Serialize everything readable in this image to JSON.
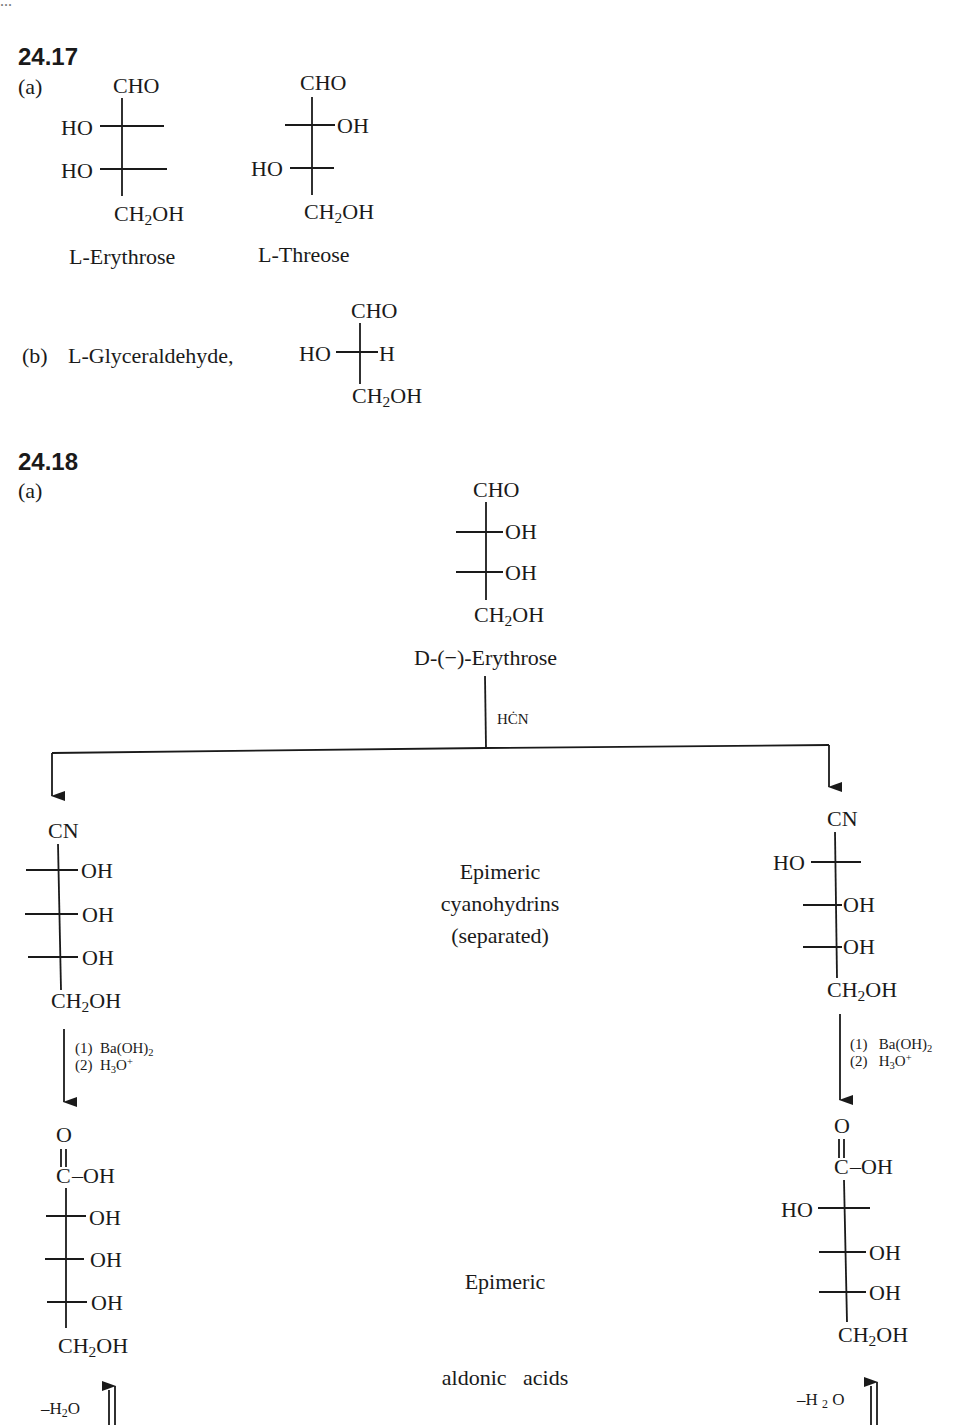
{
  "cutoff_text": "...",
  "problem_24_17": {
    "number": "24.17",
    "part_a": {
      "label": "(a)",
      "erythrose": {
        "top": "CHO",
        "row1_left": "HO",
        "row2_left": "HO",
        "bottom_main": "CH",
        "bottom_sub": "2",
        "bottom_tail": "OH",
        "name_prefix": "L",
        "name_rest": "-Erythrose"
      },
      "threose": {
        "top": "CHO",
        "row1_right": "OH",
        "row2_left": "HO",
        "bottom_main": "CH",
        "bottom_sub": "2",
        "bottom_tail": "OH",
        "name_prefix": "L",
        "name_rest": "-Threose"
      }
    },
    "part_b": {
      "label": "(b)",
      "name_prefix": "L",
      "name_rest": "-Glyceraldehyde,",
      "structure": {
        "top": "CHO",
        "left": "HO",
        "right": "H",
        "bottom_main": "CH",
        "bottom_sub": "2",
        "bottom_tail": "OH"
      }
    }
  },
  "problem_24_18": {
    "number": "24.18",
    "part_a": {
      "label": "(a)",
      "start": {
        "top": "CHO",
        "row1_right": "OH",
        "row2_right": "OH",
        "bottom_main": "CH",
        "bottom_sub": "2",
        "bottom_tail": "OH",
        "name_prefix": "D",
        "name_rest": "-(−)-Erythrose"
      },
      "reagent": "HĊN",
      "middle_label_1": [
        "Epimeric",
        "cyanohydrins",
        "(separated)"
      ],
      "middle_label_2": [
        "Epimeric",
        "aldonic   acids"
      ],
      "left_cyanohydrin": {
        "top": "CN",
        "row1_right": "OH",
        "row2_right": "OH",
        "row3_right": "OH",
        "bottom_main": "CH",
        "bottom_sub": "2",
        "bottom_tail": "OH"
      },
      "right_cyanohydrin": {
        "top": "CN",
        "row1_left": "HO",
        "row2_right": "OH",
        "row3_right": "OH",
        "bottom_main": "CH",
        "bottom_sub": "2",
        "bottom_tail": "OH"
      },
      "hydrolysis_step": {
        "step1_num": "(1)",
        "step1_main": "Ba(OH)",
        "step1_sub": "2",
        "step2_num": "(2)",
        "step2_main": "H",
        "step2_sub": "3",
        "step2_tail": "O",
        "step2_sup": "+"
      },
      "left_acid": {
        "carbonyl_o": "O",
        "c_atom": "C",
        "c_oh": "–OH",
        "row1_right": "OH",
        "row2_right": "OH",
        "row3_right": "OH",
        "bottom_main": "CH",
        "bottom_sub": "2",
        "bottom_tail": "OH"
      },
      "right_acid": {
        "carbonyl_o": "O",
        "c_atom": "C",
        "c_oh": "–OH",
        "row1_left": "HO",
        "row2_right": "OH",
        "row3_right": "OH",
        "bottom_main": "CH",
        "bottom_sub": "2",
        "bottom_tail": "OH"
      },
      "dehydration_left": {
        "main": "–H",
        "sub": "2",
        "tail": "O"
      },
      "dehydration_right": {
        "main": "–H",
        "sub": "2",
        "tail": "O"
      }
    }
  }
}
